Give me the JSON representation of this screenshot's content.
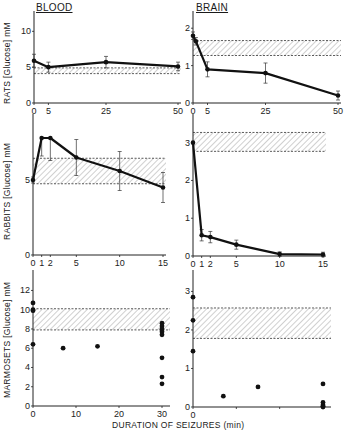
{
  "figure": {
    "column_titles": {
      "left": "BLOOD",
      "right": "BRAIN"
    },
    "row_labels": {
      "rats": "RATS [Glucose] mM",
      "rabbits": "RABBITS [Glucose] mM",
      "marmosets": "MARMOSETS [Glucose] mM"
    },
    "xlabel": "DURATION OF SEIZURES (min)"
  },
  "chart_data": [
    {
      "id": "rats-blood",
      "type": "line",
      "title": "BLOOD",
      "ylabel": "RATS [Glucose] mM",
      "xlabel": "",
      "xlim": [
        0,
        50
      ],
      "ylim": [
        0,
        12
      ],
      "xticks": [
        0,
        5,
        25,
        50
      ],
      "yticks": [
        0,
        5,
        10
      ],
      "x": [
        0,
        5,
        25,
        50
      ],
      "values": [
        5.9,
        5.0,
        5.7,
        5.1
      ],
      "error": [
        0.9,
        0.7,
        0.8,
        0.6
      ],
      "normal_range": [
        4.1,
        4.9
      ],
      "px": {
        "x0": 34,
        "x1": 178,
        "y0": 103,
        "ytop": 17
      }
    },
    {
      "id": "rats-brain",
      "type": "line",
      "title": "BRAIN",
      "ylabel": "",
      "xlim": [
        0,
        50
      ],
      "ylim": [
        0,
        2.3
      ],
      "xticks": [
        0,
        5,
        25,
        50
      ],
      "yticks": [
        0,
        1,
        2
      ],
      "x": [
        0,
        1,
        5,
        25,
        50
      ],
      "values": [
        1.8,
        1.65,
        0.9,
        0.8,
        0.2
      ],
      "error": [
        0.1,
        0.1,
        0.2,
        0.27,
        0.12
      ],
      "normal_range": [
        1.27,
        1.67
      ],
      "px": {
        "x0": 193,
        "x1": 338,
        "y0": 103,
        "ytop": 17
      }
    },
    {
      "id": "rabbits-blood",
      "type": "line",
      "ylabel": "RABBITS [Glucose] mM",
      "xlim": [
        0,
        15
      ],
      "ylim": [
        0,
        9
      ],
      "xticks": [
        0,
        1,
        2,
        5,
        10,
        15
      ],
      "yticks": [
        0,
        5
      ],
      "x": [
        0,
        1,
        2,
        5,
        10,
        15
      ],
      "values": [
        5.0,
        7.8,
        7.8,
        6.5,
        5.6,
        4.5
      ],
      "error": [
        0.2,
        -1.2,
        -1.5,
        1.2,
        1.3,
        1.0
      ],
      "normal_range": [
        4.75,
        6.45
      ],
      "px": {
        "x0": 33,
        "x1": 163,
        "y0": 255,
        "ytop": 120
      }
    },
    {
      "id": "rabbits-brain",
      "type": "line",
      "ylabel": "",
      "xlim": [
        0,
        15
      ],
      "ylim": [
        0,
        3.6
      ],
      "xticks": [
        0,
        1,
        2,
        5,
        10,
        15
      ],
      "yticks": [
        0,
        1,
        2,
        3
      ],
      "x": [
        0,
        1,
        2,
        5,
        10,
        15
      ],
      "values": [
        3.0,
        0.55,
        0.5,
        0.3,
        0.05,
        0.04
      ],
      "error": [
        0,
        0.15,
        0.15,
        0.12,
        0.06,
        0.06
      ],
      "normal_range": [
        2.77,
        3.27
      ],
      "px": {
        "x0": 193,
        "x1": 323,
        "y0": 256,
        "ytop": 120
      }
    },
    {
      "id": "marmosets-blood",
      "type": "scatter",
      "ylabel": "MARMOSETS [Glucose] mM",
      "xlim": [
        0,
        32
      ],
      "ylim": [
        0,
        13.5
      ],
      "xticks": [
        0,
        10,
        20,
        30
      ],
      "yticks": [
        0,
        2,
        4,
        6,
        8,
        10,
        12
      ],
      "points": [
        [
          0,
          10.7
        ],
        [
          0,
          10.0
        ],
        [
          0,
          9.9
        ],
        [
          0,
          6.4
        ],
        [
          7,
          6.0
        ],
        [
          15,
          6.2
        ],
        [
          30,
          8.6
        ],
        [
          30,
          8.3
        ],
        [
          30,
          8.0
        ],
        [
          30,
          7.7
        ],
        [
          30,
          7.4
        ],
        [
          30,
          5.0
        ],
        [
          30,
          3.0
        ],
        [
          30,
          2.3
        ]
      ],
      "normal_range": [
        7.9,
        10.1
      ],
      "px": {
        "x0": 33,
        "x1": 162,
        "y0": 406,
        "ytop": 276
      }
    },
    {
      "id": "marmosets-brain",
      "type": "scatter",
      "ylabel": "",
      "xlim": [
        0,
        32
      ],
      "ylim": [
        0,
        3.4
      ],
      "xticks": [
        0,
        10,
        20,
        30
      ],
      "xticklabels": [
        "0",
        "",
        "",
        ""
      ],
      "yticks": [
        0,
        1,
        2,
        3
      ],
      "points": [
        [
          0,
          2.85
        ],
        [
          0,
          2.25
        ],
        [
          0,
          1.45
        ],
        [
          7,
          0.28
        ],
        [
          15,
          0.52
        ],
        [
          30,
          0.6
        ],
        [
          30,
          0.12
        ],
        [
          30,
          0.05
        ],
        [
          30,
          0.02
        ],
        [
          30,
          0.0
        ]
      ],
      "normal_range": [
        1.78,
        2.57
      ],
      "px": {
        "x0": 193,
        "x1": 323,
        "y0": 407,
        "ytop": 276
      }
    }
  ]
}
